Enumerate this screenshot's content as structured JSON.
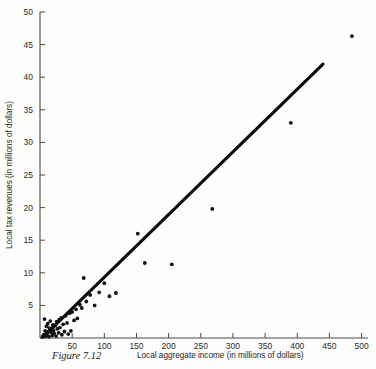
{
  "figure": {
    "caption_label": "Figure  7.12",
    "xlabel": "Local aggregate income (in millions of dollars)",
    "ylabel": "Local tax revenues (in millions of dollars)"
  },
  "chart_data": {
    "type": "scatter",
    "title": "",
    "xlabel": "Local aggregate income (in millions of dollars)",
    "ylabel": "Local tax revenues (in millions of dollars)",
    "xlim": [
      0,
      510
    ],
    "ylim": [
      0,
      50
    ],
    "xticks": [
      50,
      100,
      150,
      200,
      250,
      300,
      350,
      400,
      450,
      500
    ],
    "xtick_labels": [
      "50",
      "100",
      "150",
      "200",
      "250",
      "300",
      "350",
      "400",
      "450",
      "500"
    ],
    "yticks": [
      0,
      5,
      10,
      15,
      20,
      25,
      30,
      35,
      40,
      45,
      50
    ],
    "ytick_labels": [
      "",
      "5",
      "10",
      "15",
      "20",
      "25",
      "30",
      "35",
      "40",
      "45",
      "50"
    ],
    "grid": false,
    "legend": false,
    "marker": "filled-circle",
    "marker_color": "#111111",
    "points": [
      [
        4,
        0.2
      ],
      [
        6,
        0.5
      ],
      [
        7,
        2.9
      ],
      [
        8,
        1.1
      ],
      [
        9,
        0.3
      ],
      [
        10,
        1.8
      ],
      [
        11,
        0.6
      ],
      [
        12,
        2.2
      ],
      [
        13,
        1.0
      ],
      [
        14,
        0.2
      ],
      [
        15,
        1.5
      ],
      [
        16,
        2.6
      ],
      [
        17,
        0.9
      ],
      [
        18,
        1.3
      ],
      [
        19,
        0.4
      ],
      [
        20,
        2.0
      ],
      [
        21,
        1.2
      ],
      [
        22,
        0.7
      ],
      [
        24,
        1.9
      ],
      [
        25,
        0.3
      ],
      [
        26,
        2.5
      ],
      [
        27,
        1.4
      ],
      [
        29,
        0.8
      ],
      [
        30,
        2.8
      ],
      [
        31,
        1.6
      ],
      [
        33,
        3.1
      ],
      [
        34,
        0.5
      ],
      [
        36,
        2.1
      ],
      [
        38,
        1.0
      ],
      [
        40,
        3.4
      ],
      [
        42,
        2.3
      ],
      [
        44,
        0.6
      ],
      [
        46,
        3.8
      ],
      [
        48,
        1.1
      ],
      [
        50,
        4.0
      ],
      [
        53,
        2.7
      ],
      [
        56,
        4.4
      ],
      [
        58,
        3.0
      ],
      [
        62,
        5.1
      ],
      [
        65,
        4.6
      ],
      [
        68,
        9.2
      ],
      [
        72,
        5.6
      ],
      [
        78,
        6.6
      ],
      [
        85,
        5.0
      ],
      [
        92,
        7.0
      ],
      [
        100,
        8.4
      ],
      [
        108,
        6.4
      ],
      [
        118,
        6.9
      ],
      [
        152,
        16.0
      ],
      [
        163,
        11.5
      ],
      [
        205,
        11.3
      ],
      [
        268,
        19.8
      ],
      [
        390,
        33.0
      ],
      [
        485,
        46.3
      ]
    ],
    "trendline": {
      "label": "regression line",
      "x_start": 6,
      "y_start": 0.3,
      "x_end": 440,
      "y_end": 42.0
    }
  }
}
